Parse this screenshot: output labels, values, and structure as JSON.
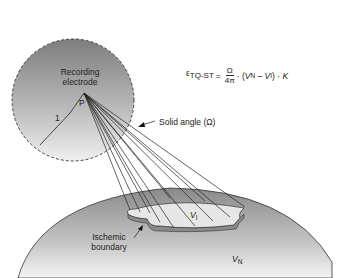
{
  "labels": {
    "recording_electrode_line1": "Recording",
    "recording_electrode_line2": "electrode",
    "point": "P",
    "radius": "1",
    "solid_angle": "Solid angle (Ω)",
    "ischemic_line1": "Ischemic",
    "ischemic_line2": "boundary",
    "v_i": "V",
    "v_i_sub": "I",
    "v_n": "V",
    "v_n_sub": "N"
  },
  "equation": {
    "epsilon": "ε",
    "epsilon_sub": "TQ-ST",
    "equals": "=",
    "numerator": "Ω",
    "denominator": "4π",
    "middle": "· (",
    "vn": "V",
    "vn_sub": "N",
    "minus": " – ",
    "vi": "V",
    "vi_sub": "I",
    "tail": ") · ",
    "k": "K"
  }
}
